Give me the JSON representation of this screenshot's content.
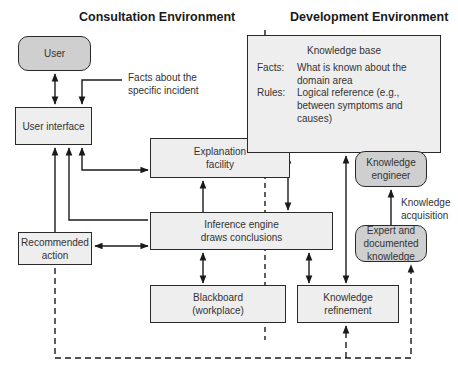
{
  "headings": {
    "consultation": "Consultation Environment",
    "development": "Development Environment"
  },
  "nodes": {
    "user": "User",
    "user_interface": "User interface",
    "explanation_facility": "Explanation\nfacility",
    "inference_engine": "Inference engine\ndraws conclusions",
    "recommended_action": "Recommended\naction",
    "blackboard": "Blackboard\n(workplace)",
    "knowledge_refinement": "Knowledge\nrefinement",
    "knowledge_engineer": "Knowledge\nengineer",
    "expert_knowledge": "Expert and\ndocumented\nknowledge"
  },
  "knowledge_base": {
    "title": "Knowledge base",
    "facts_key": "Facts:",
    "facts_value": "What is known about the\ndomain area",
    "rules_key": "Rules:",
    "rules_value": "Logical reference (e.g.,\nbetween symptoms and\ncauses)"
  },
  "annotations": {
    "facts_incident": "Facts about the\nspecific incident",
    "knowledge_acquisition": "Knowledge\nacquisition"
  },
  "colors": {
    "box_fill": "#eeeeee",
    "rounded_fill": "#cfcfcf",
    "stroke": "#2a2a2a"
  }
}
